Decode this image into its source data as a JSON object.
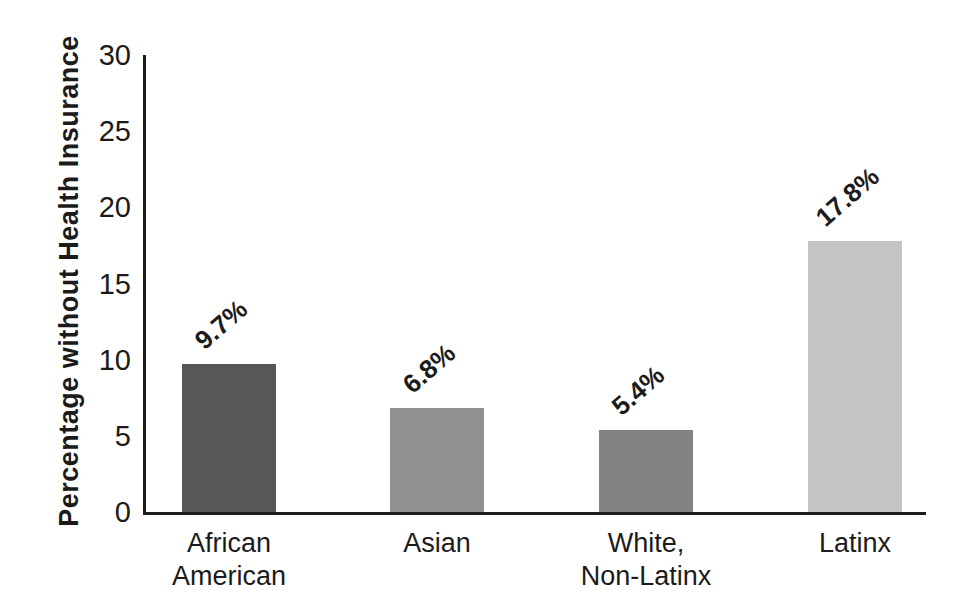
{
  "figure": {
    "background_color": "#ffffff",
    "text_color": "#1b1b1b",
    "axis_color": "#1c1c1c"
  },
  "chart_data": {
    "type": "bar",
    "title": "",
    "xlabel": "",
    "ylabel": "Percentage without Health Insurance",
    "ylim": [
      0,
      30
    ],
    "yticks": [
      0,
      5,
      10,
      15,
      20,
      25,
      30
    ],
    "grid": false,
    "legend": null,
    "categories": [
      "African American",
      "Asian",
      "White, Non-Latinx",
      "Latinx"
    ],
    "category_label_lines": [
      [
        "African",
        "American"
      ],
      [
        "Asian"
      ],
      [
        "White,",
        "Non-Latinx"
      ],
      [
        "Latinx"
      ]
    ],
    "values": [
      9.7,
      6.8,
      5.4,
      17.8
    ],
    "value_labels": [
      "9.7%",
      "6.8%",
      "5.4%",
      "17.8%"
    ],
    "value_label_rotation_deg": -41,
    "bar_colors": [
      "#575757",
      "#909090",
      "#838383",
      "#c4c4c4"
    ]
  }
}
